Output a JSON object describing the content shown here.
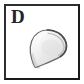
{
  "figure": {
    "panel_label": "D",
    "background_color": "#ffffff",
    "frame_color": "#1f1f1f",
    "label_color": "#242424"
  },
  "specimen": {
    "name": "shell-valve-outline",
    "description": "teardrop shaped bivalve shell valve, pointed umbo at lower left, broad rounded margin at upper right",
    "fill_color": "#e9e9e9",
    "highlight_color": "#fafafa",
    "shadow_color": "#c4c4c4",
    "outline_color": "#6e6e6e",
    "outline_dark_color": "#4a4a4a"
  }
}
